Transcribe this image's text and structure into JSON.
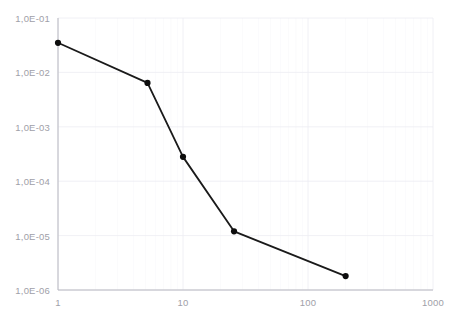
{
  "chart_data": {
    "type": "line",
    "title": "",
    "subtitle": "",
    "xlabel": "",
    "ylabel": "",
    "xscale": "log",
    "yscale": "log",
    "xlim": [
      1,
      1000
    ],
    "ylim": [
      1e-06,
      0.1
    ],
    "grid": true,
    "legend": false,
    "legend_position": "none",
    "x_tick_labels": [
      "1",
      "10",
      "100",
      "1000"
    ],
    "x_tick_values": [
      1,
      10,
      100,
      1000
    ],
    "y_tick_labels": [
      "1,0E-01",
      "1,0E-02",
      "1,0E-03",
      "1,0E-04",
      "1,0E-05",
      "1,0E-06"
    ],
    "y_tick_values": [
      0.1,
      0.01,
      0.001,
      0.0001,
      1e-05,
      1e-06
    ],
    "series": [
      {
        "name": "series-1",
        "color": "#1a1a1a",
        "marker": "circle",
        "x": [
          1,
          5.2,
          10,
          25.6,
          200
        ],
        "y": [
          0.035,
          0.0064,
          0.00028,
          1.2e-05,
          1.8e-06
        ],
        "points": [
          {
            "x": 1,
            "y": 0.035
          },
          {
            "x": 5.2,
            "y": 0.0064
          },
          {
            "x": 10,
            "y": 0.00028
          },
          {
            "x": 25.6,
            "y": 1.2e-05
          },
          {
            "x": 200,
            "y": 1.8e-06
          }
        ]
      }
    ],
    "colors": {
      "line": "#1a1a1a",
      "marker": "#0d0d0d",
      "axis": "#b8b8c0",
      "grid": "#ececf2",
      "tick_text": "#a0a0a8",
      "background": "#ffffff"
    }
  }
}
